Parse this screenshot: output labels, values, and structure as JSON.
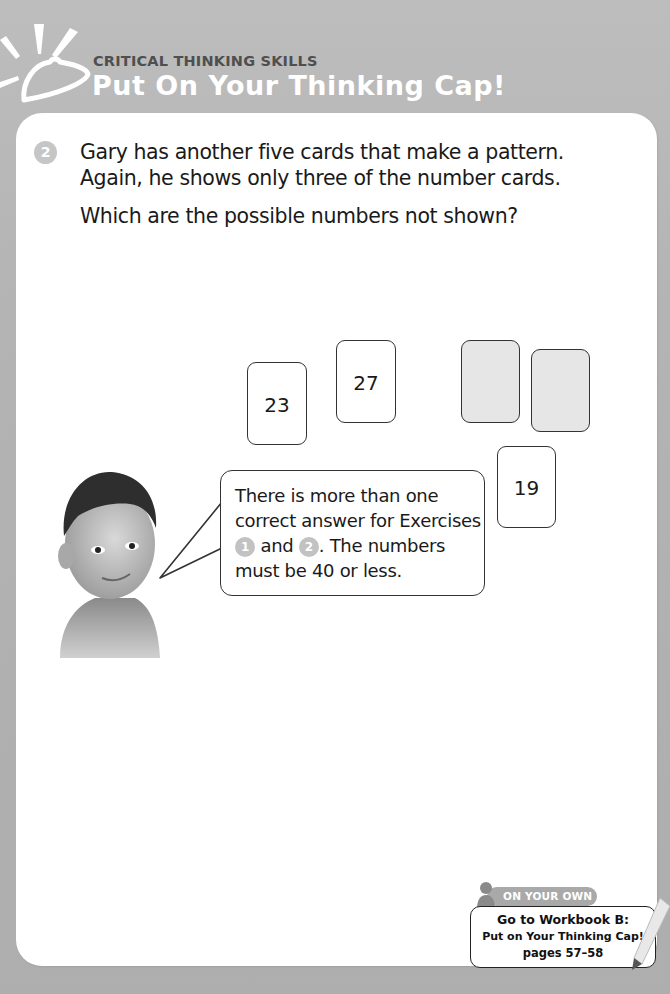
{
  "header": {
    "subtitle": "CRITICAL THINKING SKILLS",
    "title": "Put On Your Thinking Cap!",
    "logo_icon": "thinking-cap-icon"
  },
  "exercise": {
    "number": "2",
    "lines": [
      "Gary has another five cards that make a pattern.",
      "Again, he shows only three of the number cards."
    ],
    "question": "Which are the possible numbers not shown?"
  },
  "cards": [
    {
      "value": "23",
      "hidden": false
    },
    {
      "value": "27",
      "hidden": false
    },
    {
      "value": "",
      "hidden": true
    },
    {
      "value": "",
      "hidden": true
    },
    {
      "value": "19",
      "hidden": false
    }
  ],
  "hint": {
    "line1": "There is more than one",
    "line2": "correct answer for Exercises",
    "badge1": "1",
    "and": "and",
    "badge2": "2",
    "line3_end": ". The numbers",
    "line4": "must be 40 or less."
  },
  "workbook": {
    "tag": "ON YOUR OWN",
    "line1": "Go to Workbook B:",
    "line2": "Put on Your Thinking Cap!",
    "line3": "pages 57–58"
  },
  "colors": {
    "page_bg": "#b3b3b3",
    "panel_bg": "#ffffff",
    "badge_gray": "#c6c6c6",
    "hidden_card": "#e6e6e6"
  }
}
